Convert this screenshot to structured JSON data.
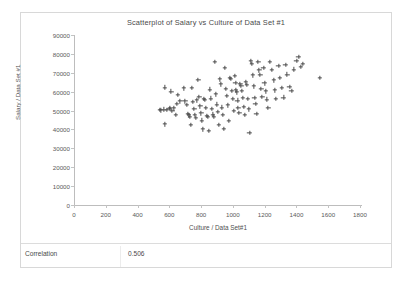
{
  "chart_data": {
    "type": "scatter",
    "title": "Scatterplot of Salary vs Culture of Data Set #1",
    "xlabel": "Culture / Data Set#1",
    "ylabel": "Salary / Data Set #1",
    "xlim": [
      0,
      1800
    ],
    "ylim": [
      0,
      90000
    ],
    "xticks": [
      0,
      200,
      400,
      600,
      800,
      1000,
      1200,
      1400,
      1600,
      1800
    ],
    "yticks": [
      0,
      10000,
      20000,
      30000,
      40000,
      50000,
      60000,
      70000,
      80000,
      90000
    ],
    "grid": false,
    "legend": false,
    "marker": "plus",
    "marker_color": "#4b4b4b",
    "series": [
      {
        "name": "Salary vs Culture",
        "points": [
          [
            540,
            50500
          ],
          [
            548,
            50200
          ],
          [
            565,
            50600
          ],
          [
            570,
            62300
          ],
          [
            572,
            42800
          ],
          [
            585,
            50300
          ],
          [
            600,
            50900
          ],
          [
            604,
            51300
          ],
          [
            612,
            60100
          ],
          [
            618,
            49900
          ],
          [
            628,
            51200
          ],
          [
            640,
            47600
          ],
          [
            648,
            53500
          ],
          [
            655,
            58300
          ],
          [
            668,
            54900
          ],
          [
            690,
            61800
          ],
          [
            700,
            55000
          ],
          [
            710,
            52900
          ],
          [
            716,
            48200
          ],
          [
            722,
            47500
          ],
          [
            728,
            46900
          ],
          [
            734,
            42500
          ],
          [
            742,
            62100
          ],
          [
            748,
            54700
          ],
          [
            756,
            51000
          ],
          [
            762,
            47900
          ],
          [
            768,
            46200
          ],
          [
            774,
            55500
          ],
          [
            782,
            66200
          ],
          [
            788,
            57200
          ],
          [
            794,
            52300
          ],
          [
            800,
            48600
          ],
          [
            806,
            44800
          ],
          [
            812,
            40100
          ],
          [
            818,
            56200
          ],
          [
            824,
            55800
          ],
          [
            830,
            51600
          ],
          [
            836,
            47300
          ],
          [
            842,
            46600
          ],
          [
            848,
            39400
          ],
          [
            856,
            61200
          ],
          [
            862,
            56400
          ],
          [
            868,
            50800
          ],
          [
            874,
            48000
          ],
          [
            880,
            46900
          ],
          [
            888,
            75900
          ],
          [
            894,
            58700
          ],
          [
            900,
            53300
          ],
          [
            906,
            49200
          ],
          [
            912,
            42600
          ],
          [
            918,
            66600
          ],
          [
            924,
            63900
          ],
          [
            930,
            51700
          ],
          [
            936,
            47800
          ],
          [
            942,
            40500
          ],
          [
            950,
            72500
          ],
          [
            956,
            61500
          ],
          [
            962,
            57700
          ],
          [
            968,
            52800
          ],
          [
            974,
            44600
          ],
          [
            982,
            67400
          ],
          [
            988,
            66900
          ],
          [
            994,
            60300
          ],
          [
            1000,
            56100
          ],
          [
            1006,
            49800
          ],
          [
            1012,
            68400
          ],
          [
            1016,
            64600
          ],
          [
            1020,
            60800
          ],
          [
            1024,
            59700
          ],
          [
            1028,
            55400
          ],
          [
            1034,
            51500
          ],
          [
            1040,
            48700
          ],
          [
            1046,
            64100
          ],
          [
            1052,
            63200
          ],
          [
            1058,
            60400
          ],
          [
            1064,
            56800
          ],
          [
            1070,
            52100
          ],
          [
            1076,
            47600
          ],
          [
            1082,
            65000
          ],
          [
            1088,
            63700
          ],
          [
            1094,
            56300
          ],
          [
            1100,
            50700
          ],
          [
            1104,
            38100
          ],
          [
            1112,
            76100
          ],
          [
            1118,
            74700
          ],
          [
            1124,
            68700
          ],
          [
            1130,
            62900
          ],
          [
            1136,
            56700
          ],
          [
            1142,
            53600
          ],
          [
            1148,
            48400
          ],
          [
            1160,
            75800
          ],
          [
            1166,
            71400
          ],
          [
            1172,
            68900
          ],
          [
            1178,
            61400
          ],
          [
            1184,
            57400
          ],
          [
            1192,
            72600
          ],
          [
            1198,
            64500
          ],
          [
            1206,
            60200
          ],
          [
            1214,
            55900
          ],
          [
            1222,
            51300
          ],
          [
            1232,
            75900
          ],
          [
            1244,
            71600
          ],
          [
            1256,
            66100
          ],
          [
            1264,
            60800
          ],
          [
            1272,
            56200
          ],
          [
            1286,
            73700
          ],
          [
            1296,
            67300
          ],
          [
            1306,
            61900
          ],
          [
            1318,
            57000
          ],
          [
            1330,
            74200
          ],
          [
            1342,
            69100
          ],
          [
            1356,
            62600
          ],
          [
            1368,
            60600
          ],
          [
            1382,
            71800
          ],
          [
            1400,
            76300
          ],
          [
            1412,
            78300
          ],
          [
            1426,
            73300
          ],
          [
            1440,
            74900
          ],
          [
            1546,
            67200
          ]
        ]
      }
    ]
  },
  "footer": {
    "correlation_label": "Correlation",
    "correlation_value": "0.506"
  }
}
